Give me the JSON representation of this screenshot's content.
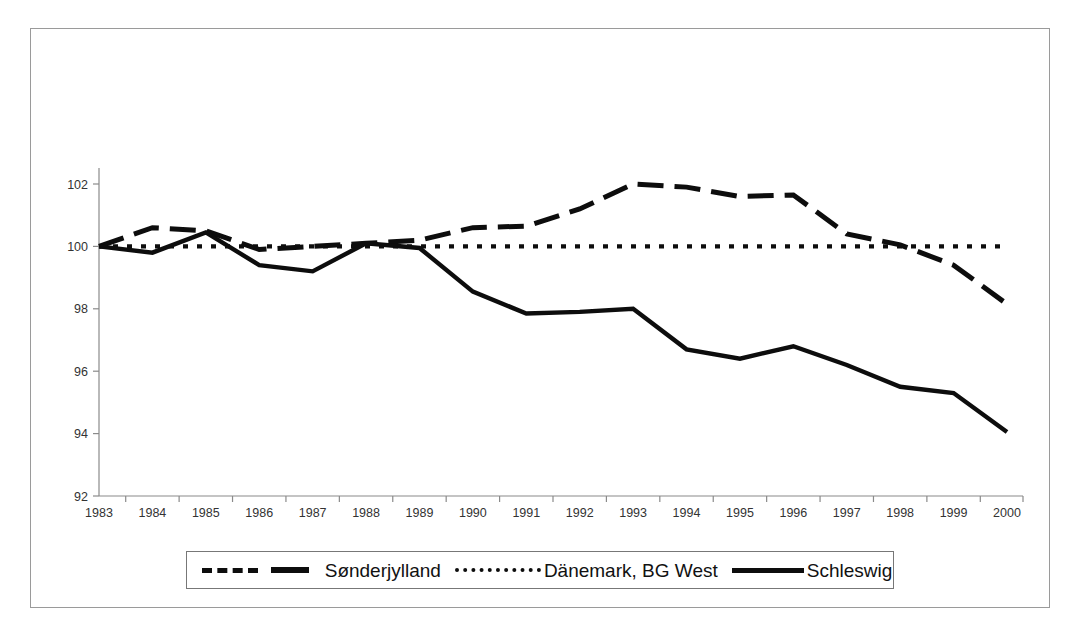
{
  "chart_data": {
    "type": "line",
    "title": "",
    "subtitle": "",
    "xlabel": "",
    "ylabel": "",
    "categories": [
      "1983",
      "1984",
      "1985",
      "1986",
      "1987",
      "1988",
      "1989",
      "1990",
      "1991",
      "1992",
      "1993",
      "1994",
      "1995",
      "1996",
      "1997",
      "1998",
      "1999",
      "2000"
    ],
    "ylim": [
      92,
      102
    ],
    "yticks": [
      92,
      94,
      96,
      98,
      100,
      102
    ],
    "ytick_labels": [
      "92",
      "94",
      "96",
      "98",
      "100",
      "102"
    ],
    "grid": false,
    "legend_position": "bottom",
    "series": [
      {
        "name": "Sønderjylland",
        "style": "dashed",
        "color": "#0d0d0d",
        "values": [
          100.0,
          100.6,
          100.5,
          99.9,
          100.0,
          100.1,
          100.2,
          100.6,
          100.65,
          101.2,
          102.0,
          101.9,
          101.6,
          101.65,
          100.4,
          100.05,
          99.4,
          98.15
        ]
      },
      {
        "name": "Dänemark, BG West",
        "style": "dotted",
        "color": "#0d0d0d",
        "values": [
          100.0,
          100.0,
          100.0,
          100.0,
          100.0,
          100.0,
          100.0,
          100.0,
          100.0,
          100.0,
          100.0,
          100.0,
          100.0,
          100.0,
          100.0,
          100.0,
          100.0,
          100.0
        ]
      },
      {
        "name": "Schleswig",
        "style": "solid",
        "color": "#0d0d0d",
        "values": [
          100.0,
          99.8,
          100.45,
          99.4,
          99.2,
          100.1,
          99.95,
          98.55,
          97.85,
          97.9,
          98.0,
          96.7,
          96.4,
          96.8,
          96.2,
          95.5,
          95.3,
          94.05
        ]
      }
    ]
  },
  "axes": {
    "y_axis_name": "index-value-axis",
    "x_axis_name": "year-axis"
  },
  "legend": {
    "entries": [
      {
        "label": "Sønderjylland",
        "style": "dashed"
      },
      {
        "label": "Dänemark, BG West",
        "style": "dotted"
      },
      {
        "label": "Schleswig",
        "style": "solid"
      }
    ]
  }
}
